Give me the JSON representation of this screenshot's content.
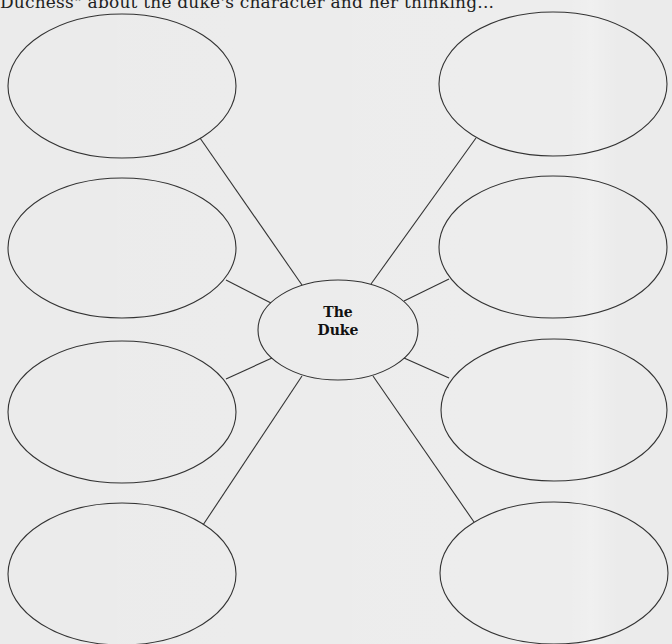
{
  "header": {
    "text": "Duchess\" about the duke's character and her thinking..."
  },
  "diagram": {
    "type": "web-organizer",
    "stroke_color": "#333333",
    "background_color": "#ebebeb",
    "center": {
      "line1": "The",
      "line2": "Duke",
      "cx": 338,
      "cy": 330,
      "rx": 80,
      "ry": 50
    },
    "nodes": [
      {
        "id": "top-left",
        "cx": 122,
        "cy": 86,
        "rx": 114,
        "ry": 72,
        "text": ""
      },
      {
        "id": "mid-upper-left",
        "cx": 122,
        "cy": 248,
        "rx": 114,
        "ry": 70,
        "text": ""
      },
      {
        "id": "mid-lower-left",
        "cx": 122,
        "cy": 412,
        "rx": 114,
        "ry": 71,
        "text": ""
      },
      {
        "id": "bottom-left",
        "cx": 122,
        "cy": 574,
        "rx": 114,
        "ry": 71,
        "text": ""
      },
      {
        "id": "top-right",
        "cx": 553,
        "cy": 84,
        "rx": 114,
        "ry": 72,
        "text": ""
      },
      {
        "id": "mid-upper-right",
        "cx": 553,
        "cy": 247,
        "rx": 114,
        "ry": 71,
        "text": ""
      },
      {
        "id": "mid-lower-right",
        "cx": 554,
        "cy": 410,
        "rx": 113,
        "ry": 71,
        "text": ""
      },
      {
        "id": "bottom-right",
        "cx": 554,
        "cy": 573,
        "rx": 114,
        "ry": 71,
        "text": ""
      }
    ],
    "connectors": [
      {
        "from": "center",
        "to": "top-left",
        "x1": 302,
        "y1": 285,
        "x2": 200,
        "y2": 138
      },
      {
        "from": "center",
        "to": "mid-upper-left",
        "x1": 271,
        "y1": 303,
        "x2": 226,
        "y2": 280
      },
      {
        "from": "center",
        "to": "mid-lower-left",
        "x1": 272,
        "y1": 358,
        "x2": 226,
        "y2": 379
      },
      {
        "from": "center",
        "to": "bottom-left",
        "x1": 302,
        "y1": 376,
        "x2": 203,
        "y2": 525
      },
      {
        "from": "center",
        "to": "top-right",
        "x1": 371,
        "y1": 284,
        "x2": 476,
        "y2": 138
      },
      {
        "from": "center",
        "to": "mid-upper-right",
        "x1": 404,
        "y1": 301,
        "x2": 449,
        "y2": 279
      },
      {
        "from": "center",
        "to": "mid-lower-right",
        "x1": 404,
        "y1": 358,
        "x2": 449,
        "y2": 378
      },
      {
        "from": "center",
        "to": "bottom-right",
        "x1": 373,
        "y1": 376,
        "x2": 474,
        "y2": 522
      }
    ]
  }
}
